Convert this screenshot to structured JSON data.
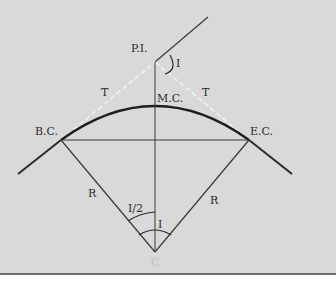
{
  "diagram": {
    "type": "horizontal circular curve geometry",
    "labels": {
      "pi": "P.I.",
      "bc": "B.C.",
      "ec": "E.C.",
      "mc": "M.C.",
      "tangent_left": "T",
      "tangent_right": "T",
      "radius_left": "R",
      "radius_right": "R",
      "deflection_angle": "I",
      "half_angle": "I/2",
      "central_angle": "I",
      "center": "C"
    },
    "colors": {
      "background": "#d9d9d9",
      "line": "#2a2a2a",
      "dashed": "#f2f2f2"
    }
  }
}
